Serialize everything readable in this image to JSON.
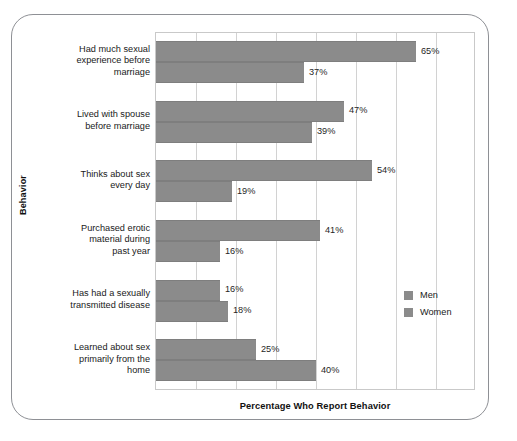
{
  "chart_data": {
    "type": "bar",
    "orientation": "horizontal",
    "title": "",
    "xlabel": "Percentage Who Report Behavior",
    "ylabel": "Behavior",
    "xlim": [
      0,
      80
    ],
    "xtick_step": 10,
    "grid": true,
    "grid_axis": "x",
    "legend_position": "right-middle",
    "categories": [
      "Had much sexual experience before marriage",
      "Lived with spouse before marriage",
      "Thinks about sex every day",
      "Purchased erotic material during past year",
      "Has had a sexually transmitted disease",
      "Learned about sex primarily from the home"
    ],
    "category_label_lines": [
      [
        "Had much sexual",
        "experience before",
        "marriage"
      ],
      [
        "Lived with spouse",
        "before marriage"
      ],
      [
        "Thinks about sex",
        "every day"
      ],
      [
        "Purchased erotic",
        "material during",
        "past year"
      ],
      [
        "Has had a sexually",
        "transmitted disease"
      ],
      [
        "Learned about sex",
        "primarily from the",
        "home"
      ]
    ],
    "series": [
      {
        "name": "Men",
        "color": "#8b8b8b",
        "values": [
          65,
          47,
          54,
          41,
          16,
          25
        ],
        "value_labels": [
          "65%",
          "47%",
          "54%",
          "41%",
          "16%",
          "25%"
        ]
      },
      {
        "name": "Women",
        "color": "#8b8b8b",
        "values": [
          37,
          39,
          19,
          16,
          18,
          40
        ],
        "value_labels": [
          "37%",
          "39%",
          "19%",
          "16%",
          "18%",
          "40%"
        ]
      }
    ]
  },
  "legend": {
    "items": [
      {
        "label": "Men",
        "color": "#8b8b8b"
      },
      {
        "label": "Women",
        "color": "#8b8b8b"
      }
    ]
  },
  "axes": {
    "x_title": "Percentage Who Report Behavior",
    "y_title": "Behavior"
  },
  "colors": {
    "bar": "#8b8b8b",
    "gridline": "#d2d2d2",
    "plot_border": "#c9c9c9",
    "frame_border": "#8e9095",
    "text": "#1a1a1a"
  }
}
